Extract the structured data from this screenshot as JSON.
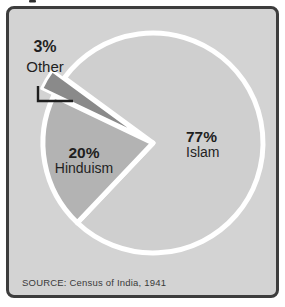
{
  "panel": {
    "background_color": "#d3d3d3",
    "border_color": "#3d3d3d"
  },
  "source_note": "SOURCE: Census of India, 1941",
  "chart_data": {
    "type": "pie",
    "title": "",
    "categories": [
      "Islam",
      "Hinduism",
      "Other"
    ],
    "values": [
      77,
      20,
      3
    ],
    "source_note": "SOURCE: Census of India, 1941",
    "legend": "none",
    "labels_position": "inside, Other labeled outside with leader line",
    "slices": [
      {
        "label": "Islam",
        "pct": 77,
        "pct_label": "77%",
        "color": "#cfcfcf",
        "exploded": false
      },
      {
        "label": "Hinduism",
        "pct": 20,
        "pct_label": "20%",
        "color": "#b3b3b3",
        "exploded": false
      },
      {
        "label": "Other",
        "pct": 3,
        "pct_label": "3%",
        "color": "#8a8a8a",
        "exploded": true
      }
    ],
    "layout": {
      "boundary_angle_deg": 143.7,
      "ccw_order_from_boundary": [
        "Other",
        "Hinduism",
        "Islam"
      ],
      "explode_px": 14,
      "separator_color": "#ffffff"
    }
  }
}
